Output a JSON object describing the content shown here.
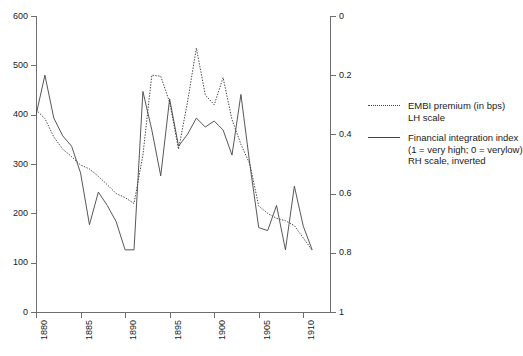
{
  "chart_data": {
    "type": "line",
    "title": "",
    "subtitle": "",
    "xlabel": "",
    "ylabel": "",
    "xlim": [
      1880,
      1913
    ],
    "xticks": [
      1880,
      1885,
      1890,
      1895,
      1900,
      1905,
      1910
    ],
    "xticklabels": [
      "1880",
      "1885",
      "1890",
      "1895",
      "1900",
      "1905",
      "1910"
    ],
    "grid": false,
    "legend_position": "right",
    "axes": [
      {
        "id": "left",
        "side": "left",
        "label": "",
        "ylim": [
          0,
          600
        ],
        "inverted": false,
        "ticks": [
          0,
          100,
          200,
          300,
          400,
          500,
          600
        ],
        "ticklabels": [
          "0",
          "100",
          "200",
          "300",
          "400",
          "500",
          "600"
        ]
      },
      {
        "id": "right",
        "side": "right",
        "label": "",
        "ylim": [
          0,
          1
        ],
        "inverted": true,
        "ticks": [
          0,
          0.2,
          0.4,
          0.6,
          0.8,
          1
        ],
        "ticklabels": [
          "0",
          "0.2",
          "0.4",
          "0.6",
          "0.8",
          "1"
        ]
      }
    ],
    "x": [
      1880,
      1881,
      1882,
      1883,
      1884,
      1885,
      1886,
      1887,
      1888,
      1889,
      1890,
      1891,
      1892,
      1893,
      1894,
      1895,
      1896,
      1897,
      1898,
      1899,
      1900,
      1901,
      1902,
      1903,
      1904,
      1905,
      1906,
      1907,
      1908,
      1909,
      1910,
      1911
    ],
    "series": [
      {
        "name": "EMBI premium (in bps)",
        "axis": "left",
        "style": "dotted",
        "color": "#444444",
        "values": [
          410,
          392,
          355,
          330,
          315,
          298,
          290,
          275,
          258,
          240,
          232,
          220,
          318,
          480,
          478,
          425,
          330,
          425,
          535,
          440,
          420,
          475,
          390,
          340,
          300,
          215,
          200,
          190,
          185,
          175,
          150,
          125
        ]
      },
      {
        "name": "Financial integration index (1 = very high; 0 = verylow)",
        "axis": "right",
        "style": "solid",
        "color": "#444444",
        "values": [
          0.335,
          0.2,
          0.345,
          0.405,
          0.44,
          0.53,
          0.705,
          0.595,
          0.64,
          0.695,
          0.79,
          0.79,
          0.255,
          0.385,
          0.54,
          0.28,
          0.44,
          0.4,
          0.345,
          0.375,
          0.355,
          0.385,
          0.47,
          0.265,
          0.5,
          0.715,
          0.725,
          0.64,
          0.79,
          0.575,
          0.71,
          0.79
        ]
      }
    ]
  },
  "legend": {
    "entries": [
      {
        "style": "dotted",
        "line1": "EMBI premium (in bps)",
        "line2": "LH scale",
        "line3": ""
      },
      {
        "style": "solid",
        "line1": "Financial integration index",
        "line2": "(1 = very high; 0 = verylow)",
        "line3": "RH scale, inverted"
      }
    ]
  }
}
